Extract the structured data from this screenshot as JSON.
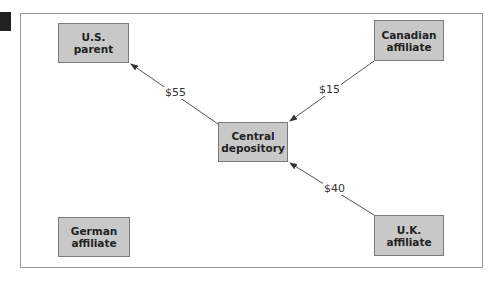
{
  "diagram": {
    "nodes": [
      {
        "id": "us-parent",
        "label": "U.S.\nparent"
      },
      {
        "id": "canadian-affiliate",
        "label": "Canadian\naffiliate"
      },
      {
        "id": "central-depository",
        "label": "Central\ndepository"
      },
      {
        "id": "german-affiliate",
        "label": "German\naffiliate"
      },
      {
        "id": "uk-affiliate",
        "label": "U.K.\naffiliate"
      }
    ],
    "edges": [
      {
        "from": "central-depository",
        "to": "us-parent",
        "label": "$55"
      },
      {
        "from": "canadian-affiliate",
        "to": "central-depository",
        "label": "$15"
      },
      {
        "from": "uk-affiliate",
        "to": "central-depository",
        "label": "$40"
      }
    ]
  }
}
